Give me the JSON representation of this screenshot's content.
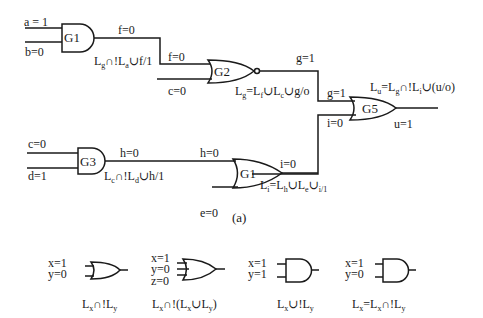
{
  "figure": {
    "caption": "(a)",
    "circuit": {
      "gates": [
        {
          "id": "G1_top",
          "name": "G1",
          "type": "AND",
          "inputs": [
            "a = 1",
            "b=0"
          ],
          "output": "f=0",
          "eq": {
            "p1": "L",
            "s1": "g",
            "p2": "∩!L",
            "s2": "a",
            "p3": "∪f/1"
          }
        },
        {
          "id": "G2",
          "name": "G2",
          "type": "NOR",
          "inputs": [
            "f=0",
            "c=0"
          ],
          "output": "g=1",
          "eq": {
            "p1": "L",
            "s1": "g",
            "p2": "=L",
            "s2": "f",
            "p3": "∪L",
            "s3": "c",
            "p4": "∪g/o"
          }
        },
        {
          "id": "G3",
          "name": "G3",
          "type": "AND",
          "inputs": [
            "c=0",
            "d=1"
          ],
          "output": "h=0",
          "eq": {
            "p1": "L",
            "s1": "c",
            "p2": "∩!L",
            "s2": "d",
            "p3": "∪h/1"
          }
        },
        {
          "id": "G1_bottom",
          "name": "G1",
          "type": "OR",
          "inputs": [
            "h=0",
            "e=0"
          ],
          "output": "i=0",
          "eq": {
            "p1": "L",
            "s1": "i",
            "p2": "=L",
            "s2": "h",
            "p3": "∪L",
            "s3": "e",
            "p4": "∪",
            "s4": "i/1"
          }
        },
        {
          "id": "G5",
          "name": "G5",
          "type": "OR",
          "inputs": [
            "g=1",
            "i=0"
          ],
          "output": "u=1",
          "eq": {
            "p1": "L",
            "s1": "u",
            "p2": "=L",
            "s2": "g",
            "p3": "∩!L",
            "s3": "i",
            "p4": "∪(u/o)"
          }
        }
      ],
      "wire_labels": {
        "f_in_g2": "f=0",
        "g_top": "g=1",
        "h_in_g1": "h=0"
      }
    },
    "legend_gates": [
      {
        "type": "OR",
        "inputs": [
          "x=1",
          "y=0"
        ],
        "eq": {
          "p1": "L",
          "s1": "x",
          "p2": "∩!L",
          "s2": "y"
        }
      },
      {
        "type": "OR",
        "inputs": [
          "x=1",
          "y=0",
          "z=0"
        ],
        "eq": {
          "p1": "L",
          "s1": "x",
          "p2": "∩!(L",
          "s2": "x",
          "p3": "∪L",
          "s3": "y",
          "p4": ")"
        }
      },
      {
        "type": "AND",
        "inputs": [
          "x=1",
          "y=1"
        ],
        "eq": {
          "p1": "L",
          "s1": "x",
          "p2": "∪!L",
          "s2": "y"
        }
      },
      {
        "type": "AND",
        "inputs": [
          "x=1",
          "y=0"
        ],
        "eq": {
          "p1": "L",
          "s1": "x",
          "p2": "=L",
          "s2": "x",
          "p3": "∩!L",
          "s3": "y"
        }
      }
    ]
  }
}
